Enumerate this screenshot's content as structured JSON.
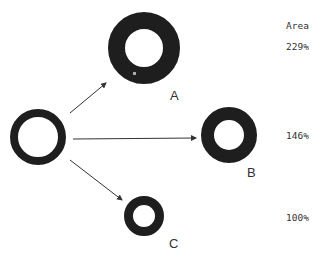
{
  "header": {
    "area_label": "Area"
  },
  "colors": {
    "ring": "#1e1e1e",
    "arrow": "#333333",
    "text": "#333333"
  },
  "source": {
    "cx": 38,
    "cy": 137,
    "r_outer": 28,
    "r_inner": 20
  },
  "targets": [
    {
      "label": "A",
      "area": "229%",
      "cx": 144,
      "cy": 48,
      "r_outer": 36,
      "r_inner": 19
    },
    {
      "label": "B",
      "area": "146%",
      "cx": 229,
      "cy": 135,
      "r_outer": 28,
      "r_inner": 15
    },
    {
      "label": "C",
      "area": "100%",
      "cx": 144,
      "cy": 216,
      "r_outer": 20,
      "r_inner": 11
    }
  ]
}
